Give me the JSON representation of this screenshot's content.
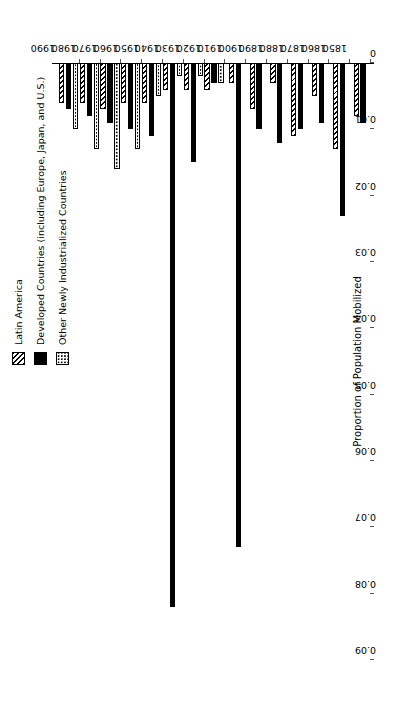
{
  "chart_data": {
    "type": "bar",
    "orientation": "horizontal",
    "title": "",
    "xlabel": "",
    "ylabel": "Proportion of Population Mobilized",
    "ylim": [
      0,
      0.09
    ],
    "yticks": [
      "0",
      "0.01",
      "0.02",
      "0.03",
      "0.04",
      "0.05",
      "0.06",
      "0.07",
      "0.08",
      "0.09"
    ],
    "grid": false,
    "legend_position": "top-left",
    "categories": [
      "1850",
      "1860",
      "1870",
      "1880",
      "1890",
      "1900",
      "1910",
      "1920",
      "1930",
      "1940",
      "1950",
      "1960",
      "1970",
      "1980",
      "1990"
    ],
    "series": [
      {
        "name": "Latin America",
        "pattern": "diagonal-hatch",
        "values": [
          0.008,
          0.013,
          0.005,
          0.011,
          0.003,
          0.007,
          0.003,
          0.004,
          0.004,
          0.004,
          0.006,
          0.006,
          0.007,
          0.006,
          0.006
        ]
      },
      {
        "name": "Developed Countries (including Europe, Japan, and U.S.)",
        "pattern": "solid-black",
        "values": [
          0.009,
          0.023,
          0.009,
          0.01,
          0.012,
          0.01,
          0.073,
          0.003,
          0.015,
          0.082,
          0.011,
          0.01,
          0.009,
          0.008,
          0.007
        ]
      },
      {
        "name": "Other Newly Industrialized Countries",
        "pattern": "stipple-dots",
        "values": [
          0,
          0,
          0,
          0,
          0,
          0,
          0,
          0.003,
          0.002,
          0.002,
          0.005,
          0.013,
          0.016,
          0.013,
          0.01
        ]
      }
    ]
  },
  "legend": {
    "items": [
      {
        "label": "Latin America",
        "swatch": "hatch-swatch-icon"
      },
      {
        "label": "Developed Countries (including Europe, Japan, and U.S.)",
        "swatch": "solid-swatch-icon"
      },
      {
        "label": "Other Newly Industrialized Countries",
        "swatch": "dots-swatch-icon"
      }
    ]
  },
  "axes": {
    "value_axis_title": "Proportion of Population Mobilized"
  }
}
